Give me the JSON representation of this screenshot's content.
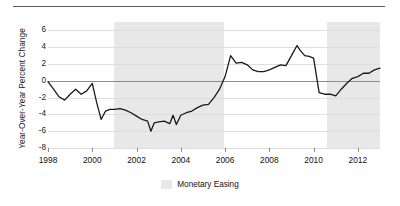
{
  "chart_data": {
    "type": "line",
    "title": "",
    "xlabel": "",
    "ylabel": "Year-Over-Year Percent Change",
    "xlim": [
      1998.0,
      2013.0
    ],
    "ylim": [
      -8,
      7
    ],
    "grid": true,
    "legend_position": "bottom-center",
    "y_ticks": [
      6,
      4,
      2,
      0,
      -2,
      -4,
      -6,
      -8
    ],
    "y_tick_labels": [
      "6",
      "4",
      "2",
      "0",
      "-2",
      "-4",
      "-6",
      "-8"
    ],
    "x_ticks": [
      1998,
      2000,
      2002,
      2004,
      2006,
      2008,
      2010,
      2012
    ],
    "x_tick_labels": [
      "1998",
      "2000",
      "2002",
      "2004",
      "2006",
      "2008",
      "2010",
      "2012"
    ],
    "series": [
      {
        "name": "Year-Over-Year Percent Change",
        "color": "#1a1a1a",
        "x": [
          1998.0,
          1998.25,
          1998.5,
          1998.75,
          1999.0,
          1999.25,
          1999.5,
          1999.75,
          2000.0,
          2000.2,
          2000.4,
          2000.6,
          2000.8,
          2001.0,
          2001.25,
          2001.5,
          2001.75,
          2002.0,
          2002.25,
          2002.5,
          2002.65,
          2002.8,
          2003.0,
          2003.25,
          2003.5,
          2003.65,
          2003.8,
          2004.0,
          2004.25,
          2004.5,
          2004.75,
          2005.0,
          2005.25,
          2005.5,
          2005.75,
          2006.0,
          2006.25,
          2006.5,
          2006.75,
          2007.0,
          2007.25,
          2007.5,
          2007.75,
          2008.0,
          2008.25,
          2008.5,
          2008.75,
          2009.0,
          2009.25,
          2009.4,
          2009.6,
          2009.8,
          2010.0,
          2010.25,
          2010.5,
          2010.75,
          2011.0,
          2011.25,
          2011.5,
          2011.75,
          2012.0,
          2012.25,
          2012.5,
          2012.75,
          2013.0
        ],
        "y": [
          -0.1,
          -1.0,
          -1.9,
          -2.3,
          -1.6,
          -1.0,
          -1.6,
          -1.2,
          -0.3,
          -2.6,
          -4.6,
          -3.6,
          -3.4,
          -3.4,
          -3.3,
          -3.5,
          -3.8,
          -4.2,
          -4.6,
          -4.8,
          -6.0,
          -5.0,
          -4.9,
          -4.8,
          -5.1,
          -4.1,
          -5.2,
          -4.1,
          -3.8,
          -3.6,
          -3.2,
          -2.9,
          -2.8,
          -2.0,
          -1.0,
          0.5,
          3.0,
          2.1,
          2.2,
          1.9,
          1.3,
          1.1,
          1.1,
          1.3,
          1.6,
          1.9,
          1.8,
          3.0,
          4.2,
          3.6,
          3.0,
          2.9,
          2.7,
          -1.4,
          -1.6,
          -1.6,
          -1.8,
          -1.0,
          -0.3,
          0.3,
          0.5,
          0.9,
          0.9,
          1.3,
          1.5
        ]
      }
    ],
    "shaded_regions": [
      {
        "label": "Monetary Easing",
        "start": 2001.0,
        "end": 2005.95,
        "color": "#e8e8e8"
      },
      {
        "label": "Monetary Easing",
        "start": 2010.6,
        "end": 2013.0,
        "color": "#e8e8e8"
      }
    ],
    "legend": [
      {
        "label": "Monetary Easing",
        "color": "#e8e8e8"
      }
    ],
    "annotations": []
  },
  "legend": {
    "label": "Monetary Easing"
  },
  "axis": {
    "y_title": "Year-Over-Year Percent Change"
  }
}
